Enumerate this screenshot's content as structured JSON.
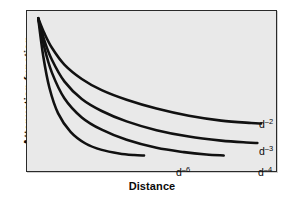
{
  "figure": {
    "title": "",
    "background_color": "#ffffff",
    "plot_background_color": "#e9e9e9",
    "frame_color": "#2a2a2a",
    "curve_color": "#111111"
  },
  "axes": {
    "xlabel": "Distance",
    "ylabel": "Attenuation function",
    "x_ticks": [],
    "y_ticks": [],
    "grid": false
  },
  "labels": {
    "d2": {
      "base": "d",
      "exponent": "–2"
    },
    "d3": {
      "base": "d",
      "exponent": "–3"
    },
    "d4": {
      "base": "d",
      "exponent": "–4"
    },
    "d6": {
      "base": "d",
      "exponent": "–6"
    }
  },
  "chart_data": {
    "type": "line",
    "title": "",
    "subtitle": "",
    "xlabel": "Distance",
    "ylabel": "Attenuation function",
    "xlim": [
      0,
      1
    ],
    "ylim": [
      0,
      1
    ],
    "grid": false,
    "legend": "inline-end-of-curve",
    "x_tick_labels": [],
    "y_tick_labels": [],
    "annotations": [
      "d–2",
      "d–3",
      "d–4",
      "d–6"
    ],
    "note": "Four power-law attenuation curves, all emanating from a common point at the upper-left and decaying monotonically to the right; steeper exponent decays faster. x and y axes are unlabeled/qualitative.",
    "series": [
      {
        "name": "d–2",
        "exponent": -2,
        "x": [
          0.045,
          0.07,
          0.1,
          0.15,
          0.22,
          0.3,
          0.4,
          0.52,
          0.65,
          0.78,
          0.9,
          0.94
        ],
        "y": [
          0.955,
          0.86,
          0.77,
          0.665,
          0.575,
          0.505,
          0.445,
          0.39,
          0.345,
          0.315,
          0.3,
          0.297
        ]
      },
      {
        "name": "d–3",
        "exponent": -3,
        "x": [
          0.045,
          0.07,
          0.1,
          0.15,
          0.22,
          0.3,
          0.4,
          0.52,
          0.65,
          0.78,
          0.88,
          0.925
        ],
        "y": [
          0.955,
          0.815,
          0.695,
          0.56,
          0.45,
          0.375,
          0.31,
          0.255,
          0.215,
          0.19,
          0.178,
          0.175
        ]
      },
      {
        "name": "d–4",
        "exponent": -4,
        "x": [
          0.045,
          0.07,
          0.1,
          0.15,
          0.22,
          0.3,
          0.4,
          0.52,
          0.63,
          0.72,
          0.79
        ],
        "y": [
          0.955,
          0.77,
          0.615,
          0.455,
          0.335,
          0.258,
          0.195,
          0.145,
          0.118,
          0.103,
          0.097
        ]
      },
      {
        "name": "d–6",
        "exponent": -6,
        "x": [
          0.045,
          0.065,
          0.09,
          0.125,
          0.175,
          0.235,
          0.3,
          0.37,
          0.43,
          0.47
        ],
        "y": [
          0.955,
          0.72,
          0.52,
          0.36,
          0.245,
          0.172,
          0.132,
          0.11,
          0.1,
          0.097
        ]
      }
    ]
  }
}
